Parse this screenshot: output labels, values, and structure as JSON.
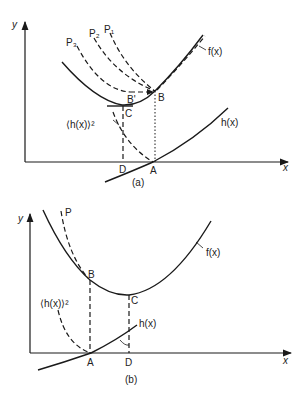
{
  "panel_a": {
    "caption": "(a)",
    "axis_x_label": "x",
    "axis_y_label": "y",
    "curve_f_label": "f(x)",
    "curve_h_label": "h(x)",
    "curve_h2_label": "⟨h(x)⟩²",
    "path_labels": [
      "P₃",
      "P₂",
      "P₁"
    ],
    "point_B": "B",
    "point_B_prime": "B'",
    "point_C": "C",
    "point_D": "D",
    "point_A": "A"
  },
  "panel_b": {
    "caption": "(b)",
    "axis_x_label": "x",
    "axis_y_label": "y",
    "curve_f_label": "f(x)",
    "curve_h_label": "h(x)",
    "curve_h2_label": "⟨h(x)⟩²",
    "path_label": "P",
    "point_B": "B",
    "point_C": "C",
    "point_A": "A",
    "point_D": "D"
  },
  "colors": {
    "line": "#1a1a1a",
    "background": "#ffffff"
  }
}
